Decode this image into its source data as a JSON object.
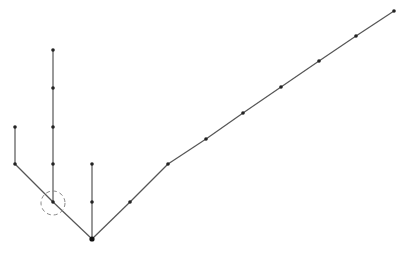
{
  "diagram": {
    "type": "tree",
    "colors": {
      "edge": "#555555",
      "node": "#222222",
      "highlight": "#888888",
      "background": "#ffffff"
    },
    "root": {
      "id": "r",
      "x": 92,
      "y": 239,
      "r": 2.6
    },
    "nodes": [
      {
        "id": "a1",
        "x": 53,
        "y": 202
      },
      {
        "id": "a2",
        "x": 15,
        "y": 164
      },
      {
        "id": "a3",
        "x": 15,
        "y": 127
      },
      {
        "id": "b1",
        "x": 53,
        "y": 164
      },
      {
        "id": "b2",
        "x": 53,
        "y": 127
      },
      {
        "id": "b3",
        "x": 53,
        "y": 88
      },
      {
        "id": "b4",
        "x": 53,
        "y": 50
      },
      {
        "id": "c1",
        "x": 92,
        "y": 202
      },
      {
        "id": "c2",
        "x": 92,
        "y": 164
      },
      {
        "id": "d1",
        "x": 130,
        "y": 202
      },
      {
        "id": "d2",
        "x": 168,
        "y": 164
      },
      {
        "id": "d3",
        "x": 206,
        "y": 139
      },
      {
        "id": "d4",
        "x": 243,
        "y": 113
      },
      {
        "id": "d5",
        "x": 281,
        "y": 87
      },
      {
        "id": "d6",
        "x": 319,
        "y": 61
      },
      {
        "id": "d7",
        "x": 356,
        "y": 36
      },
      {
        "id": "d8",
        "x": 394,
        "y": 11
      }
    ],
    "edges": [
      [
        "r",
        "a1"
      ],
      [
        "a1",
        "a2"
      ],
      [
        "a2",
        "a3"
      ],
      [
        "a1",
        "b1"
      ],
      [
        "b1",
        "b2"
      ],
      [
        "b2",
        "b3"
      ],
      [
        "b3",
        "b4"
      ],
      [
        "r",
        "c1"
      ],
      [
        "c1",
        "c2"
      ],
      [
        "r",
        "d1"
      ],
      [
        "d1",
        "d2"
      ],
      [
        "d2",
        "d3"
      ],
      [
        "d3",
        "d4"
      ],
      [
        "d4",
        "d5"
      ],
      [
        "d5",
        "d6"
      ],
      [
        "d6",
        "d7"
      ],
      [
        "d7",
        "d8"
      ]
    ],
    "highlight": {
      "node": "a1",
      "cx": 53,
      "cy": 203,
      "r": 12,
      "style": "dashed"
    }
  }
}
